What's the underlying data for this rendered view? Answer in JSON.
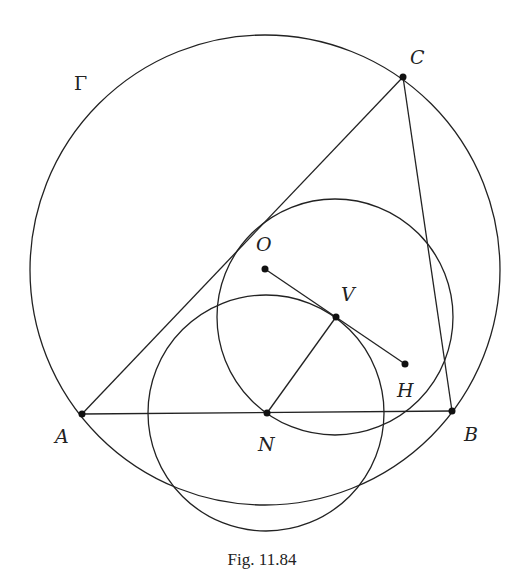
{
  "figure": {
    "caption": "Fig. 11.84",
    "stroke_color": "#222222",
    "background": "#ffffff"
  },
  "points": {
    "A": {
      "label": "A",
      "x": 82,
      "y": 414
    },
    "B": {
      "label": "B",
      "x": 452,
      "y": 411
    },
    "C": {
      "label": "C",
      "x": 403,
      "y": 77
    },
    "N": {
      "label": "N",
      "x": 267,
      "y": 413
    },
    "O": {
      "label": "O",
      "x": 265,
      "y": 269
    },
    "V": {
      "label": "V",
      "x": 336,
      "y": 317
    },
    "H": {
      "label": "H",
      "x": 405,
      "y": 364
    }
  },
  "circles": {
    "gamma": {
      "label": "Γ",
      "cx": 265,
      "cy": 270,
      "r": 235
    },
    "upper": {
      "cx": 335,
      "cy": 317,
      "r": 118
    },
    "lower": {
      "cx": 266,
      "cy": 413,
      "r": 118
    }
  },
  "segments": [
    "AB",
    "BC",
    "CA",
    "OH",
    "NV"
  ]
}
